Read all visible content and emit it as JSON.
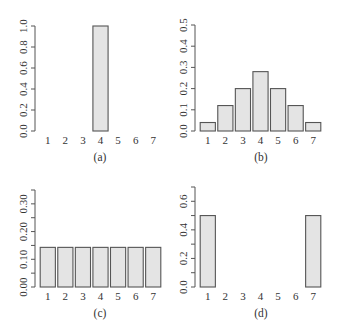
{
  "figure": {
    "background": "#ffffff",
    "bar_fill": "#e4e4e4",
    "bar_stroke": "#555555",
    "axis_color": "#555555",
    "text_color": "#333333"
  },
  "chart_data": [
    {
      "type": "bar",
      "panel": "top-left",
      "caption": "(a)",
      "title": "",
      "xlabel": "",
      "ylabel": "",
      "categories": [
        "1",
        "2",
        "3",
        "4",
        "5",
        "6",
        "7"
      ],
      "values": [
        0,
        0,
        0,
        1.0,
        0,
        0,
        0
      ],
      "ylim": [
        0,
        1.0
      ],
      "yticks": [
        0.0,
        0.2,
        0.4,
        0.6,
        0.8,
        1.0
      ],
      "ytick_labels": [
        "0.0",
        "0.2",
        "0.4",
        "0.6",
        "0.8",
        "1.0"
      ],
      "grid": false,
      "legend": "none"
    },
    {
      "type": "bar",
      "panel": "top-right",
      "caption": "(b)",
      "title": "",
      "xlabel": "",
      "ylabel": "",
      "categories": [
        "1",
        "2",
        "3",
        "4",
        "5",
        "6",
        "7"
      ],
      "values": [
        0.04,
        0.12,
        0.2,
        0.28,
        0.2,
        0.12,
        0.04
      ],
      "ylim": [
        0,
        0.5
      ],
      "yticks": [
        0.0,
        0.1,
        0.2,
        0.3,
        0.4,
        0.5
      ],
      "ytick_labels": [
        "0.0",
        "0.1",
        "0.2",
        "0.3",
        "0.4",
        "0.5"
      ],
      "grid": false,
      "legend": "none"
    },
    {
      "type": "bar",
      "panel": "bottom-left",
      "caption": "(c)",
      "title": "",
      "xlabel": "",
      "ylabel": "",
      "categories": [
        "1",
        "2",
        "3",
        "4",
        "5",
        "6",
        "7"
      ],
      "values": [
        0.143,
        0.143,
        0.143,
        0.143,
        0.143,
        0.143,
        0.143
      ],
      "ylim": [
        0,
        0.35
      ],
      "yticks": [
        0.0,
        0.05,
        0.1,
        0.15,
        0.2,
        0.25,
        0.3,
        0.35
      ],
      "ytick_labels": [
        "0.00",
        "",
        "0.10",
        "",
        "0.20",
        "",
        "0.30",
        ""
      ],
      "grid": false,
      "legend": "none"
    },
    {
      "type": "bar",
      "panel": "bottom-right",
      "caption": "(d)",
      "title": "",
      "xlabel": "",
      "ylabel": "",
      "categories": [
        "1",
        "2",
        "3",
        "4",
        "5",
        "6",
        "7"
      ],
      "values": [
        0.5,
        0,
        0,
        0,
        0,
        0,
        0.5
      ],
      "ylim": [
        0,
        0.7
      ],
      "yticks": [
        0.0,
        0.1,
        0.2,
        0.3,
        0.4,
        0.5,
        0.6,
        0.7
      ],
      "ytick_labels": [
        "0.0",
        "",
        "0.2",
        "",
        "0.4",
        "",
        "0.6",
        ""
      ],
      "grid": false,
      "legend": "none"
    }
  ]
}
